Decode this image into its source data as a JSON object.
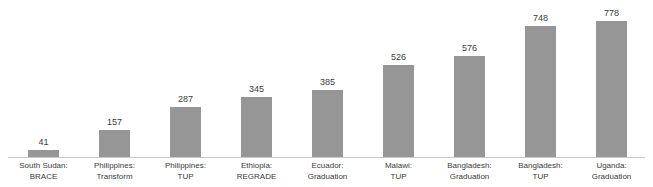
{
  "chart_data": {
    "type": "bar",
    "title": "",
    "xlabel": "",
    "ylabel": "",
    "ylim": [
      0,
      778
    ],
    "grid": false,
    "legend": null,
    "bar_color": "#969696",
    "axis_color": "#c9c9c9",
    "background": "#ffffff",
    "categories": [
      "South Sudan: BRACE",
      "Philippines: Transform",
      "Philippines: TUP",
      "Ethiopia: REGRADE",
      "Ecuador: Graduation",
      "Malawi: TUP",
      "Bangladesh: Graduation",
      "Bangladesh: TUP",
      "Uganda: Graduation"
    ],
    "category_lines": [
      [
        "South Sudan:",
        "BRACE"
      ],
      [
        "Philippines:",
        "Transform"
      ],
      [
        "Philippines:",
        "TUP"
      ],
      [
        "Ethiopia:",
        "REGRADE"
      ],
      [
        "Ecuador:",
        "Graduation"
      ],
      [
        "Malawi:",
        "TUP"
      ],
      [
        "Bangladesh:",
        "Graduation"
      ],
      [
        "Bangladesh:",
        "TUP"
      ],
      [
        "Uganda:",
        "Graduation"
      ]
    ],
    "values": [
      41,
      157,
      287,
      345,
      385,
      526,
      576,
      748,
      778
    ],
    "value_labels": [
      "41",
      "157",
      "287",
      "345",
      "385",
      "526",
      "576",
      "748",
      "778"
    ]
  }
}
